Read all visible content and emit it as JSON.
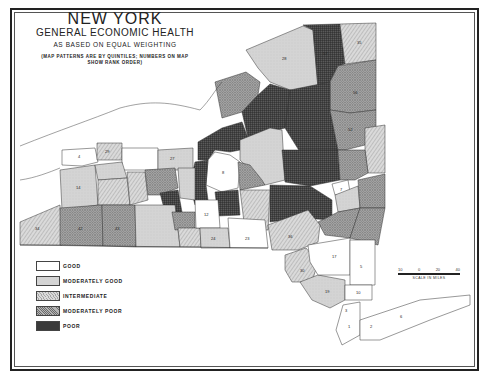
{
  "title": {
    "line1": "NEW YORK",
    "line2": "GENERAL ECONOMIC HEALTH",
    "line3": "AS BASED ON EQUAL WEIGHTING",
    "note_line1": "(MAP PATTERNS ARE BY QUINTILES; NUMBERS ON MAP",
    "note_line2": "SHOW RANK ORDER)"
  },
  "legend": {
    "items": [
      {
        "label": "GOOD",
        "pattern": "white"
      },
      {
        "label": "MODERATELY GOOD",
        "pattern": "light-gray"
      },
      {
        "label": "INTERMEDIATE",
        "pattern": "hatched"
      },
      {
        "label": "MODERATELY POOR",
        "pattern": "crosshatch"
      },
      {
        "label": "POOR",
        "pattern": "dense-grid"
      }
    ]
  },
  "scale": {
    "ticks": [
      "10",
      "0",
      "20",
      "40"
    ],
    "label": "SCALE IN MILES"
  },
  "colors": {
    "good": "#ffffff",
    "moderately_good": "#d6d6d6",
    "intermediate": "#c8c8c8",
    "moderately_poor": "#9a9a9a",
    "poor": "#3a3a3a",
    "outline": "#333333"
  },
  "counties": [
    {
      "region": "far-west-north",
      "rank": "4",
      "quintile": "good"
    },
    {
      "region": "west-lake-ontario",
      "rank": "29",
      "quintile": "intermediate"
    },
    {
      "region": "erie",
      "rank": "14",
      "quintile": "moderately_good"
    },
    {
      "region": "chautauqua",
      "rank": "34",
      "quintile": "intermediate"
    },
    {
      "region": "cattaraugus",
      "rank": "42",
      "quintile": "moderately_poor"
    },
    {
      "region": "allegany",
      "rank": "43",
      "quintile": "moderately_poor"
    },
    {
      "region": "monroe-area",
      "rank": "",
      "quintile": "good"
    },
    {
      "region": "wayne",
      "rank": "27",
      "quintile": "moderately_good"
    },
    {
      "region": "onondaga",
      "rank": "8",
      "quintile": "good"
    },
    {
      "region": "broome",
      "rank": "12",
      "quintile": "good"
    },
    {
      "region": "tioga",
      "rank": "24",
      "quintile": "moderately_good"
    },
    {
      "region": "delaware-south",
      "rank": "23",
      "quintile": "good"
    },
    {
      "region": "st-lawrence",
      "rank": "28",
      "quintile": "moderately_good"
    },
    {
      "region": "franklin",
      "rank": "57",
      "quintile": "poor"
    },
    {
      "region": "clinton",
      "rank": "35",
      "quintile": "intermediate"
    },
    {
      "region": "essex",
      "rank": "56",
      "quintile": "moderately_poor"
    },
    {
      "region": "warren-washington",
      "rank": "52",
      "quintile": "moderately_poor"
    },
    {
      "region": "schenectady",
      "rank": "7",
      "quintile": "good"
    },
    {
      "region": "ulster",
      "rank": "36",
      "quintile": "intermediate"
    },
    {
      "region": "orange",
      "rank": "30",
      "quintile": "intermediate"
    },
    {
      "region": "rockland",
      "rank": "19",
      "quintile": "moderately_good"
    },
    {
      "region": "westchester",
      "rank": "5",
      "quintile": "good"
    },
    {
      "region": "putnam",
      "rank": "10",
      "quintile": "good"
    },
    {
      "region": "dutchess",
      "rank": "17",
      "quintile": "good"
    },
    {
      "region": "nyc-bronx",
      "rank": "3",
      "quintile": "good"
    },
    {
      "region": "nyc-manhattan",
      "rank": "1",
      "quintile": "good"
    },
    {
      "region": "nassau",
      "rank": "2",
      "quintile": "good"
    },
    {
      "region": "suffolk",
      "rank": "6",
      "quintile": "good"
    }
  ]
}
